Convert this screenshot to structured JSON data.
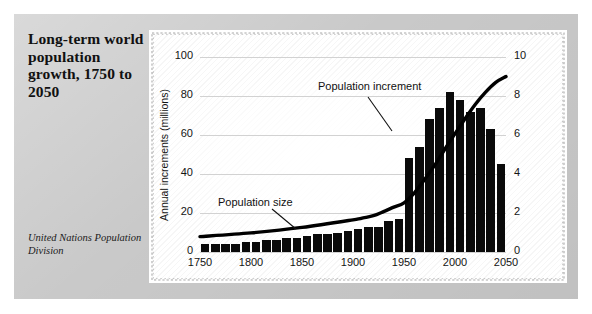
{
  "caption": {
    "title": "Long-term world population growth, 1750 to 2050",
    "source": "United Nations Population Division"
  },
  "annotations": {
    "increment": "Population increment",
    "size": "Population size"
  },
  "colors": {
    "panel": "#c9c9c9",
    "card": "#ffffff",
    "bar": "#0a0a0a",
    "curve": "#000000",
    "grid": "#d2d2d2",
    "text": "#111111"
  },
  "chart_data": {
    "type": "bar",
    "title": "Long-term world population growth, 1750 to 2050",
    "xlabel": "",
    "ylabel": "Annual increments (millions)",
    "y2label": "Population size (billions)",
    "xlim": [
      1750,
      2050
    ],
    "ylim": [
      0,
      100
    ],
    "y2lim": [
      0,
      10
    ],
    "grid": true,
    "legend": "annotations",
    "xticks": [
      1750,
      1800,
      1850,
      1900,
      1950,
      2000,
      2050
    ],
    "yticks": [
      0,
      20,
      40,
      60,
      80,
      100
    ],
    "y2ticks": [
      0,
      2,
      4,
      6,
      8,
      10
    ],
    "series": [
      {
        "name": "Population increment",
        "type": "bar",
        "unit": "millions per year",
        "x": [
          1750,
          1760,
          1770,
          1780,
          1790,
          1800,
          1810,
          1820,
          1830,
          1840,
          1850,
          1860,
          1870,
          1880,
          1890,
          1900,
          1910,
          1920,
          1930,
          1940,
          1950,
          1960,
          1970,
          1980,
          1990,
          2000,
          2010,
          2020,
          2030,
          2040
        ],
        "values": [
          4,
          4,
          4,
          4,
          5,
          5,
          6,
          6,
          7,
          7,
          8,
          9,
          9,
          10,
          11,
          12,
          13,
          13,
          16,
          17,
          48,
          54,
          68,
          74,
          82,
          78,
          72,
          74,
          63,
          45
        ]
      },
      {
        "name": "Population size",
        "type": "line",
        "unit": "billions",
        "x": [
          1750,
          1800,
          1850,
          1900,
          1910,
          1920,
          1930,
          1940,
          1950,
          1960,
          1970,
          1980,
          1990,
          2000,
          2010,
          2020,
          2030,
          2040,
          2050
        ],
        "values": [
          0.79,
          0.98,
          1.26,
          1.65,
          1.75,
          1.86,
          2.07,
          2.3,
          2.52,
          3.02,
          3.7,
          4.44,
          5.27,
          6.07,
          6.85,
          7.58,
          8.2,
          8.7,
          9.0
        ]
      }
    ]
  }
}
